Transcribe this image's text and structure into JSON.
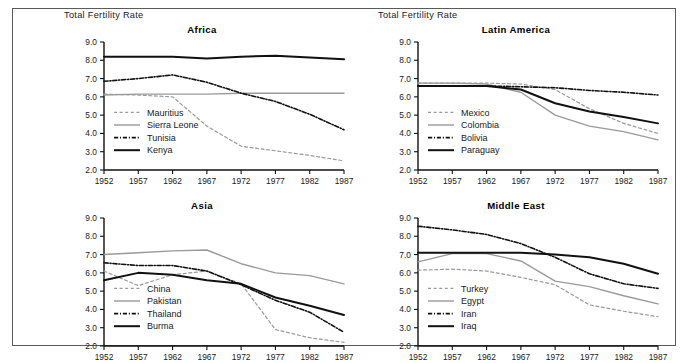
{
  "figure": {
    "background": "#ffffff",
    "border_color": "#5a5a5a",
    "y_axis_label": "Total Fertility Rate"
  },
  "colors": {
    "black": "#111111",
    "gray": "#9a9a9a",
    "text": "#1a1a1a"
  },
  "chart_data": [
    {
      "type": "line",
      "title": "Africa",
      "xlabel": "",
      "ylabel": "Total Fertility Rate",
      "x": [
        1952,
        1957,
        1962,
        1967,
        1972,
        1977,
        1982,
        1987
      ],
      "xlim": [
        1952,
        1987
      ],
      "ylim": [
        2.0,
        9.0
      ],
      "yticks": [
        "2.0",
        "3.0",
        "4.0",
        "5.0",
        "6.0",
        "7.0",
        "8.0",
        "9.0"
      ],
      "xticks": [
        "1952",
        "1957",
        "1962",
        "1967",
        "1972",
        "1977",
        "1982",
        "1987"
      ],
      "grid": false,
      "legend_position": "inside-left",
      "series": [
        {
          "name": "Mauritius",
          "style": "dashed",
          "color": "#9a9a9a",
          "width": 1.2,
          "values": [
            6.15,
            6.1,
            6.0,
            4.4,
            3.3,
            3.05,
            2.8,
            2.5
          ]
        },
        {
          "name": "Sierra Leone",
          "style": "solid",
          "color": "#9a9a9a",
          "width": 1.4,
          "values": [
            6.1,
            6.15,
            6.15,
            6.15,
            6.2,
            6.2,
            6.2,
            6.2
          ]
        },
        {
          "name": "Tunisia",
          "style": "dashdot",
          "color": "#111111",
          "width": 1.6,
          "values": [
            6.85,
            7.0,
            7.2,
            6.8,
            6.2,
            5.75,
            5.05,
            4.2
          ]
        },
        {
          "name": "Kenya",
          "style": "solid",
          "color": "#111111",
          "width": 2.0,
          "values": [
            8.2,
            8.2,
            8.2,
            8.1,
            8.2,
            8.25,
            8.15,
            8.05
          ]
        }
      ]
    },
    {
      "type": "line",
      "title": "Latin America",
      "xlabel": "",
      "ylabel": "Total Fertility Rate",
      "x": [
        1952,
        1957,
        1962,
        1967,
        1972,
        1977,
        1982,
        1987
      ],
      "xlim": [
        1952,
        1987
      ],
      "ylim": [
        2.0,
        9.0
      ],
      "yticks": [
        "2.0",
        "3.0",
        "4.0",
        "5.0",
        "6.0",
        "7.0",
        "8.0",
        "9.0"
      ],
      "xticks": [
        "1952",
        "1957",
        "1962",
        "1967",
        "1972",
        "1977",
        "1982",
        "1987"
      ],
      "grid": false,
      "legend_position": "inside-left",
      "series": [
        {
          "name": "Mexico",
          "style": "dashed",
          "color": "#9a9a9a",
          "width": 1.2,
          "values": [
            6.75,
            6.75,
            6.75,
            6.7,
            6.4,
            5.35,
            4.55,
            4.0
          ]
        },
        {
          "name": "Colombia",
          "style": "solid",
          "color": "#9a9a9a",
          "width": 1.4,
          "values": [
            6.75,
            6.75,
            6.7,
            6.25,
            5.0,
            4.4,
            4.1,
            3.65
          ]
        },
        {
          "name": "Bolivia",
          "style": "dashdot",
          "color": "#111111",
          "width": 1.6,
          "values": [
            6.6,
            6.6,
            6.6,
            6.55,
            6.5,
            6.35,
            6.25,
            6.1
          ]
        },
        {
          "name": "Paraguay",
          "style": "solid",
          "color": "#111111",
          "width": 2.0,
          "values": [
            6.6,
            6.6,
            6.6,
            6.4,
            5.65,
            5.2,
            4.9,
            4.55
          ]
        }
      ]
    },
    {
      "type": "line",
      "title": "Asia",
      "xlabel": "",
      "ylabel": "",
      "x": [
        1952,
        1957,
        1962,
        1967,
        1972,
        1977,
        1982,
        1987
      ],
      "xlim": [
        1952,
        1987
      ],
      "ylim": [
        2.0,
        9.0
      ],
      "yticks": [
        "2.0",
        "3.0",
        "4.0",
        "5.0",
        "6.0",
        "7.0",
        "8.0",
        "9.0"
      ],
      "xticks": [
        "1952",
        "1957",
        "1962",
        "1967",
        "1972",
        "1977",
        "1982",
        "1987"
      ],
      "grid": false,
      "legend_position": "inside-left",
      "series": [
        {
          "name": "China",
          "style": "dashed",
          "color": "#9a9a9a",
          "width": 1.2,
          "values": [
            6.1,
            5.3,
            5.9,
            6.1,
            5.4,
            2.9,
            2.45,
            2.2
          ]
        },
        {
          "name": "Pakistan",
          "style": "solid",
          "color": "#9a9a9a",
          "width": 1.4,
          "values": [
            7.0,
            7.1,
            7.2,
            7.25,
            6.5,
            6.0,
            5.85,
            5.4
          ]
        },
        {
          "name": "Thailand",
          "style": "dashdot",
          "color": "#111111",
          "width": 1.6,
          "values": [
            6.55,
            6.4,
            6.4,
            6.1,
            5.35,
            4.5,
            3.85,
            2.75
          ]
        },
        {
          "name": "Burma",
          "style": "solid",
          "color": "#111111",
          "width": 2.0,
          "values": [
            5.6,
            6.0,
            5.9,
            5.6,
            5.4,
            4.65,
            4.2,
            3.7
          ]
        }
      ]
    },
    {
      "type": "line",
      "title": "Middle East",
      "xlabel": "",
      "ylabel": "",
      "x": [
        1952,
        1957,
        1962,
        1967,
        1972,
        1977,
        1982,
        1987
      ],
      "xlim": [
        1952,
        1987
      ],
      "ylim": [
        2.0,
        9.0
      ],
      "yticks": [
        "2.0",
        "3.0",
        "4.0",
        "5.0",
        "6.0",
        "7.0",
        "8.0",
        "9.0"
      ],
      "xticks": [
        "1952",
        "1957",
        "1962",
        "1967",
        "1972",
        "1977",
        "1982",
        "1987"
      ],
      "grid": false,
      "legend_position": "inside-left",
      "series": [
        {
          "name": "Turkey",
          "style": "dashed",
          "color": "#9a9a9a",
          "width": 1.2,
          "values": [
            6.15,
            6.2,
            6.1,
            5.75,
            5.35,
            4.25,
            3.9,
            3.6
          ]
        },
        {
          "name": "Egypt",
          "style": "solid",
          "color": "#9a9a9a",
          "width": 1.4,
          "values": [
            6.6,
            7.05,
            7.05,
            6.65,
            5.55,
            5.25,
            4.75,
            4.3
          ]
        },
        {
          "name": "Iran",
          "style": "dashdot",
          "color": "#111111",
          "width": 1.6,
          "values": [
            8.55,
            8.35,
            8.1,
            7.6,
            6.85,
            5.95,
            5.4,
            5.15
          ]
        },
        {
          "name": "Iraq",
          "style": "solid",
          "color": "#111111",
          "width": 2.0,
          "values": [
            7.1,
            7.1,
            7.1,
            7.1,
            7.0,
            6.85,
            6.5,
            5.95
          ]
        }
      ]
    }
  ]
}
